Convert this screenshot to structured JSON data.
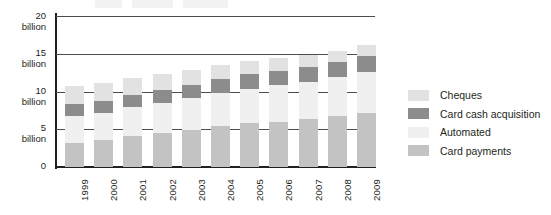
{
  "chart_data": {
    "type": "bar",
    "subtype": "stacked-vertical",
    "title": "",
    "xlabel": "",
    "ylabel": "",
    "ylim": [
      0,
      20
    ],
    "yticks": [
      0,
      5,
      10,
      15,
      20
    ],
    "ytick_labels": [
      "0",
      "5\nbillion",
      "10\nbillion",
      "15\nbillion",
      "20\nbillion"
    ],
    "grid": "horizontal",
    "legend_position": "right",
    "units": "billion",
    "categories": [
      "1999",
      "2000",
      "2001",
      "2002",
      "2003",
      "2004",
      "2005",
      "2006",
      "2007",
      "2008",
      "2009"
    ],
    "stack_order_bottom_to_top": [
      "Card payments",
      "Automated",
      "Card cash acquisition",
      "Cheques"
    ],
    "series": [
      {
        "name": "Card payments",
        "color": "#c3c3c3",
        "values": [
          3.2,
          3.6,
          4.1,
          4.5,
          4.9,
          5.4,
          5.8,
          6.0,
          6.3,
          6.7,
          7.2
        ]
      },
      {
        "name": "Automated",
        "color": "#f0f0f0",
        "values": [
          3.5,
          3.6,
          3.8,
          4.0,
          4.2,
          4.4,
          4.6,
          4.8,
          5.0,
          5.2,
          5.4
        ]
      },
      {
        "name": "Card cash acquisition",
        "color": "#8c8c8c",
        "values": [
          1.6,
          1.6,
          1.7,
          1.7,
          1.8,
          1.8,
          1.9,
          1.9,
          2.0,
          2.0,
          2.1
        ]
      },
      {
        "name": "Cheques",
        "color": "#e2e2e2",
        "values": [
          2.4,
          2.3,
          2.2,
          2.1,
          2.0,
          1.9,
          1.8,
          1.7,
          1.6,
          1.5,
          1.4
        ]
      }
    ],
    "totals": [
      10.7,
      11.1,
      11.8,
      12.3,
      12.9,
      13.5,
      14.1,
      14.4,
      14.9,
      15.4,
      16.1
    ]
  },
  "axis": {
    "y_labels": [
      {
        "value": "20",
        "unit": "billion"
      },
      {
        "value": "15",
        "unit": "billion"
      },
      {
        "value": "10",
        "unit": "billion"
      },
      {
        "value": "5",
        "unit": "billion"
      },
      {
        "value": "0",
        "unit": ""
      }
    ],
    "x_labels": [
      "1999",
      "2000",
      "2001",
      "2002",
      "2003",
      "2004",
      "2005",
      "2006",
      "2007",
      "2008",
      "2009"
    ]
  },
  "legend": {
    "items": [
      {
        "label": "Cheques",
        "color": "#e2e2e2"
      },
      {
        "label": "Card cash acquisition",
        "color": "#8c8c8c"
      },
      {
        "label": "Automated",
        "color": "#f0f0f0"
      },
      {
        "label": "Card payments",
        "color": "#c3c3c3"
      }
    ]
  },
  "colors": {
    "axis": "#231f20",
    "grid": "#4d4d4d",
    "background": "#ffffff",
    "text": "#231f20"
  }
}
